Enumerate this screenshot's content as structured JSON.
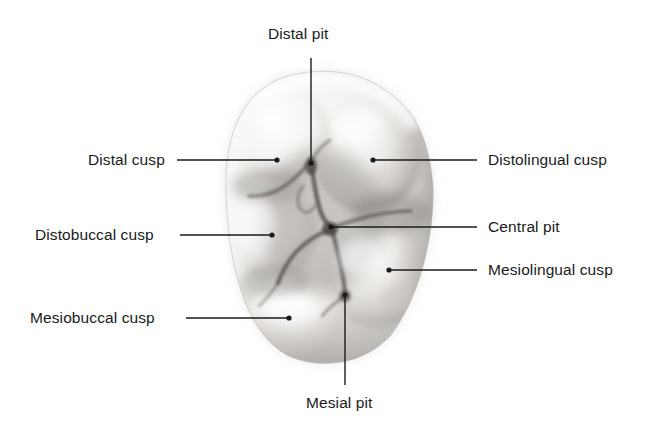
{
  "figure": {
    "background_color": "#ffffff",
    "text_color": "#1a1a1a",
    "leader_line_color": "#1a1a1a"
  },
  "annotations": [
    {
      "id": "distal-pit",
      "label": "Distal pit",
      "side": "top",
      "label_x": 268,
      "label_y": 26,
      "line": {
        "x1": 311,
        "y1": 58,
        "x2": 311,
        "y2": 163
      },
      "dot": {
        "x": 311,
        "y": 163
      }
    },
    {
      "id": "distal-cusp",
      "label": "Distal cusp",
      "side": "left",
      "label_x": 88,
      "label_y": 152,
      "line": {
        "x1": 177,
        "y1": 160,
        "x2": 277,
        "y2": 160
      },
      "dot": {
        "x": 277,
        "y": 160
      }
    },
    {
      "id": "distobuccal-cusp",
      "label": "Distobuccal cusp",
      "side": "left",
      "label_x": 35,
      "label_y": 227,
      "line": {
        "x1": 180,
        "y1": 235,
        "x2": 272,
        "y2": 235
      },
      "dot": {
        "x": 272,
        "y": 235
      }
    },
    {
      "id": "mesiobuccal-cusp",
      "label": "Mesiobuccal cusp",
      "side": "left",
      "label_x": 30,
      "label_y": 310,
      "line": {
        "x1": 186,
        "y1": 318,
        "x2": 289,
        "y2": 318
      },
      "dot": {
        "x": 289,
        "y": 318
      }
    },
    {
      "id": "distolingual-cusp",
      "label": "Distolingual cusp",
      "side": "right",
      "label_x": 488,
      "label_y": 152,
      "line": {
        "x1": 373,
        "y1": 160,
        "x2": 477,
        "y2": 160
      },
      "dot": {
        "x": 373,
        "y": 160
      }
    },
    {
      "id": "central-pit",
      "label": "Central pit",
      "side": "right",
      "label_x": 488,
      "label_y": 219,
      "line": {
        "x1": 331,
        "y1": 227,
        "x2": 477,
        "y2": 227
      },
      "dot": {
        "x": 331,
        "y": 227
      }
    },
    {
      "id": "mesiolingual-cusp",
      "label": "Mesiolingual cusp",
      "side": "right",
      "label_x": 488,
      "label_y": 262,
      "line": {
        "x1": 389,
        "y1": 270,
        "x2": 477,
        "y2": 270
      },
      "dot": {
        "x": 389,
        "y": 270
      }
    },
    {
      "id": "mesial-pit",
      "label": "Mesial pit",
      "side": "bottom",
      "label_x": 306,
      "label_y": 395,
      "line": {
        "x1": 345,
        "y1": 295,
        "x2": 345,
        "y2": 385
      },
      "dot": {
        "x": 345,
        "y": 295
      }
    }
  ],
  "tooth": {
    "name": "molar-occlusal-surface",
    "outline_points": "296,74 322,71 352,74 380,84 404,100 421,122 430,150 433,183 431,216 425,248 416,278 404,304 390,325 373,343 354,355 333,362 311,363 291,358 274,347 260,331 249,312 241,290 235,266 230,240 226,212 224,184 226,157 233,132 245,110 262,92 278,80",
    "base_fill": "#f2f1ef",
    "shadow_fill": "#b9b7b4",
    "highlight_fill": "#fbfbfa",
    "fissure_color": "#4a4846"
  }
}
